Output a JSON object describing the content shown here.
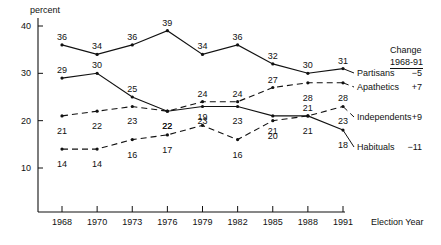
{
  "chart_data": {
    "type": "line",
    "title": "",
    "xlabel": "Election Year",
    "ylabel": "percent",
    "categories": [
      "1968",
      "1970",
      "1973",
      "1976",
      "1979",
      "1982",
      "1985",
      "1988",
      "1991"
    ],
    "ylim": [
      0,
      40
    ],
    "yticks": [
      10,
      20,
      30,
      40
    ],
    "grid": false,
    "legend_position": "right",
    "series": [
      {
        "name": "Partisans",
        "style": "solid",
        "change_1968_91": "−5",
        "values": [
          36,
          34,
          36,
          39,
          34,
          36,
          32,
          30,
          31
        ]
      },
      {
        "name": "Apathetics",
        "style": "dashed",
        "change_1968_91": "+7",
        "values": [
          21,
          22,
          23,
          22,
          24,
          24,
          27,
          28,
          28
        ]
      },
      {
        "name": "Independents",
        "style": "dashed",
        "change_1968_91": "+9",
        "values": [
          14,
          14,
          16,
          17,
          19,
          16,
          20,
          21,
          23
        ]
      },
      {
        "name": "Habituals",
        "style": "solid",
        "change_1968_91": "−11",
        "values": [
          29,
          30,
          25,
          22,
          23,
          23,
          21,
          21,
          18
        ]
      }
    ]
  },
  "legend": {
    "header_line1": "Change",
    "header_line2": "1968-91"
  }
}
